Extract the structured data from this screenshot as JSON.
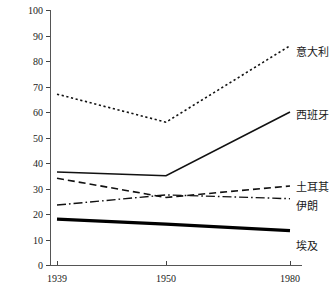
{
  "chart_data": {
    "type": "line",
    "title": "",
    "xlabel": "",
    "ylabel": "相对于西欧和美国的水平（%，经PPP调整）",
    "x": [
      1939,
      1950,
      1980
    ],
    "xticklabels": [
      "1939",
      "1950",
      "1980"
    ],
    "yticklabels": [
      "0",
      "10",
      "20",
      "30",
      "40",
      "50",
      "60",
      "70",
      "80",
      "90",
      "100"
    ],
    "yticks": [
      0,
      10,
      20,
      30,
      40,
      50,
      60,
      70,
      80,
      90,
      100
    ],
    "ylim": [
      0,
      100
    ],
    "grid": false,
    "legend_position": "right-inline",
    "series": [
      {
        "name": "意大利",
        "values": [
          67,
          56,
          86
        ],
        "style": "dotted",
        "width": 1.6,
        "color": "#111111"
      },
      {
        "name": "西班牙",
        "values": [
          36.5,
          35,
          60
        ],
        "style": "solid",
        "width": 1.6,
        "color": "#111111"
      },
      {
        "name": "土耳其",
        "values": [
          34,
          26.5,
          31
        ],
        "style": "dashed",
        "width": 1.6,
        "color": "#111111"
      },
      {
        "name": "伊朗",
        "values": [
          23.5,
          27.5,
          26
        ],
        "style": "dashdot",
        "width": 1.4,
        "color": "#111111"
      },
      {
        "name": "埃及",
        "values": [
          18,
          16,
          13.5
        ],
        "style": "solid",
        "width": 3.2,
        "color": "#000000"
      }
    ]
  },
  "axis": {
    "y_title": "相对于西欧和美国的水平（%，经PPP调整）"
  },
  "labels": {
    "italy": "意大利",
    "spain": "西班牙",
    "turkey": "土耳其",
    "iran": "伊朗",
    "egypt": "埃及"
  }
}
